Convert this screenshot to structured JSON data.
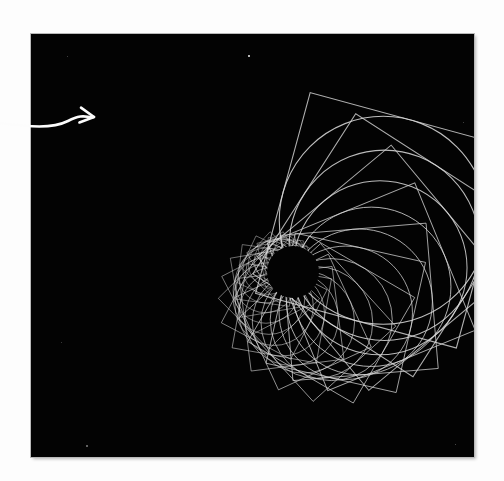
{
  "page": {
    "background_color": "#fdfdfd",
    "width": 504,
    "height": 481
  },
  "canvas": {
    "label": "generative-art-canvas",
    "background_color": "#030303",
    "border_color": "#b9b9b9",
    "x": 31,
    "y": 34,
    "width": 443,
    "height": 423
  },
  "annotation": {
    "arrow_label": "hand-drawn-pointer-arrow",
    "arrow_color": "#fcfcfc",
    "arrow_stroke_width": 2.6,
    "tail_start_x": 0,
    "tail_start_y": 123,
    "tip_x": 94,
    "tip_y": 117,
    "head_size": 13
  },
  "artwork": {
    "title": "Recursive spiral of rotating squares and circles",
    "stroke_color": "#d8d8d8",
    "stroke_width": 1.0,
    "convergence_point_x": 262,
    "convergence_point_y": 238,
    "void_radius": 26,
    "iterations": 34,
    "scale_ratio": 0.915,
    "rotation_step_degrees": 13.5,
    "start_size": 208,
    "shapes": [
      "square",
      "circle"
    ]
  },
  "speckles": [
    {
      "name": "bright-speck-top",
      "x": 248,
      "y": 55,
      "size": 2.4,
      "opacity": 0.95
    },
    {
      "name": "faint-speck-bottom-left",
      "x": 86,
      "y": 445,
      "size": 1.6,
      "opacity": 0.45
    },
    {
      "name": "faint-speck-upper-left",
      "x": 67,
      "y": 56,
      "size": 1.2,
      "opacity": 0.3
    },
    {
      "name": "faint-speck-right",
      "x": 463,
      "y": 122,
      "size": 1.2,
      "opacity": 0.3
    },
    {
      "name": "faint-speck-mid-left",
      "x": 61,
      "y": 342,
      "size": 1.1,
      "opacity": 0.28
    },
    {
      "name": "faint-speck-bottom-right",
      "x": 455,
      "y": 444,
      "size": 1.3,
      "opacity": 0.35
    }
  ]
}
